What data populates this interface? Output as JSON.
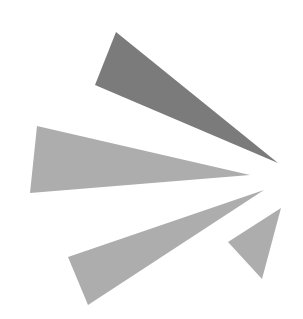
{
  "graphic": {
    "description": "Abstract burst logo of four gray triangles radiating from a point on the right",
    "colors": {
      "background": "#ffffff",
      "dark_ray": "#7b7b7b",
      "light_ray": "#adadad"
    },
    "rays": [
      {
        "name": "top-ray",
        "shade": "dark_ray"
      },
      {
        "name": "middle-ray",
        "shade": "light_ray"
      },
      {
        "name": "lower-ray",
        "shade": "light_ray"
      },
      {
        "name": "small-ray",
        "shade": "light_ray"
      }
    ]
  }
}
